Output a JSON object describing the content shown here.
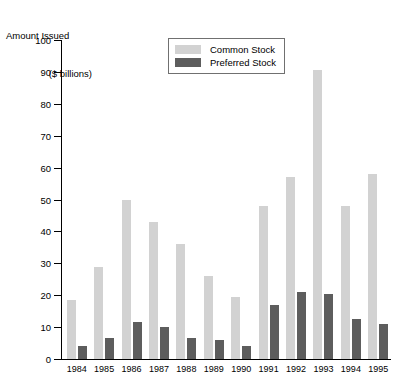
{
  "chart_data": {
    "type": "bar",
    "title": "Amount Issued ($ billions)",
    "title_line1": "Amount Issued",
    "title_line2": "($ billions)",
    "xlabel": "",
    "ylabel": "Amount Issued ($ billions)",
    "ylim": [
      0,
      100
    ],
    "yticks": [
      0,
      10,
      20,
      30,
      40,
      50,
      60,
      70,
      80,
      90,
      100
    ],
    "grid": false,
    "legend_position": "top-center",
    "categories": [
      "1984",
      "1985",
      "1986",
      "1987",
      "1988",
      "1989",
      "1990",
      "1991",
      "1992",
      "1993",
      "1994",
      "1995"
    ],
    "series": [
      {
        "name": "Common Stock",
        "color": "#d2d2d2",
        "values": [
          18.5,
          29,
          50,
          43,
          36,
          26,
          19.5,
          48,
          57,
          90.5,
          48,
          58
        ]
      },
      {
        "name": "Preferred Stock",
        "color": "#5d5d5d",
        "values": [
          4,
          6.5,
          11.5,
          10,
          6.5,
          6,
          4,
          17,
          21,
          20.5,
          12.5,
          11
        ]
      }
    ]
  },
  "legend": {
    "items": [
      {
        "label": "Common Stock",
        "color": "#d2d2d2"
      },
      {
        "label": "Preferred Stock",
        "color": "#5d5d5d"
      }
    ]
  },
  "colors": {
    "common_stock": "#d2d2d2",
    "preferred_stock": "#5d5d5d",
    "axis": "#000000",
    "background": "#ffffff"
  }
}
